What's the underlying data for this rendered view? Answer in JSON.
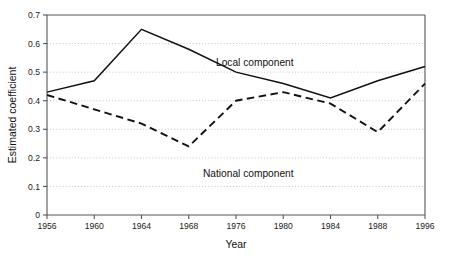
{
  "chart_data": {
    "type": "line",
    "title": "",
    "xlabel": "Year",
    "ylabel": "Estimated coefficient",
    "categories": [
      "1956",
      "1960",
      "1964",
      "1968",
      "1976",
      "1980",
      "1984",
      "1988",
      "1996"
    ],
    "x_tick_labels": [
      "1956",
      "1960",
      "1964",
      "1968",
      "1976",
      "1980",
      "1984",
      "1988",
      "1996"
    ],
    "y_tick_labels": [
      "0",
      "0.1",
      "0.2",
      "0.3",
      "0.4",
      "0.5",
      "0.6",
      "0.7"
    ],
    "y_tick_values": [
      0,
      0.1,
      0.2,
      0.3,
      0.4,
      0.5,
      0.6,
      0.7
    ],
    "ylim": [
      0,
      0.7
    ],
    "grid": "horizontal-dotted",
    "legend": "inline-annotations",
    "series": [
      {
        "name": "Local component",
        "style": "solid",
        "label": "Local component",
        "values": [
          0.43,
          0.47,
          0.65,
          0.58,
          0.5,
          0.46,
          0.41,
          0.47,
          0.52
        ]
      },
      {
        "name": "National component",
        "style": "dashed",
        "label": "National component",
        "values": [
          0.42,
          0.37,
          0.32,
          0.24,
          0.4,
          0.43,
          0.39,
          0.29,
          0.46
        ]
      }
    ],
    "annotations": [
      {
        "text": "Local component",
        "x_px": 216,
        "y_px": 66
      },
      {
        "text": "National component",
        "x_px": 203,
        "y_px": 177
      }
    ]
  },
  "plot_box": {
    "left_px": 47,
    "right_px": 425,
    "top_px": 15,
    "bottom_px": 215
  }
}
